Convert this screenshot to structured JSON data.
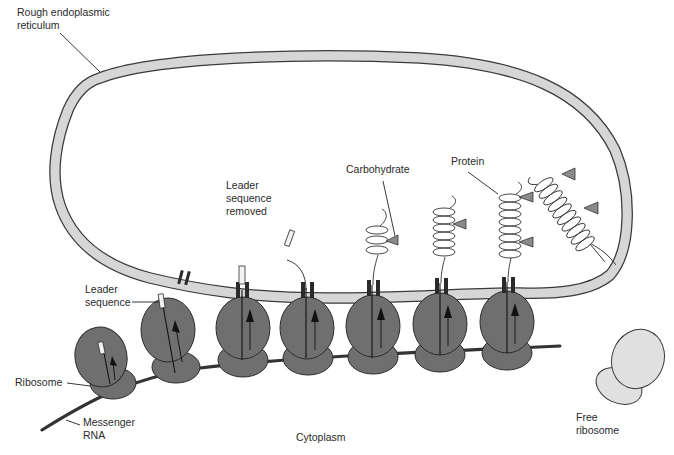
{
  "diagram": {
    "labels": {
      "rough_er": [
        "Rough endoplasmic",
        "reticulum"
      ],
      "leader_sequence_removed": [
        "Leader",
        "sequence",
        "removed"
      ],
      "carbohydrate": "Carbohydrate",
      "protein": "Protein",
      "leader_sequence": [
        "Leader",
        "sequence"
      ],
      "ribosome": "Ribosome",
      "messenger_rna": [
        "Messenger",
        "RNA"
      ],
      "cytoplasm": "Cytoplasm",
      "free_ribosome": [
        "Free",
        "ribosome"
      ]
    },
    "colors": {
      "membrane_fill": "#d6d6d6",
      "membrane_edge": "#3a3a3a",
      "bound_ribosome": "#6f6f6f",
      "free_ribosome": "#e0e0e0",
      "carbohydrate": "#8a8a8a",
      "mrna": "#333333"
    },
    "stages": [
      {
        "id": 1,
        "description": "Ribosome begins translation, leader sequence emerging"
      },
      {
        "id": 2,
        "description": "Leader sequence approaches ER membrane"
      },
      {
        "id": 3,
        "description": "Leader sequence passes through membrane channel"
      },
      {
        "id": 4,
        "description": "Leader sequence removed"
      },
      {
        "id": 5,
        "description": "Growing protein with carbohydrate attached"
      },
      {
        "id": 6,
        "description": "Longer protein with carbohydrate"
      },
      {
        "id": 7,
        "description": "Protein with two carbohydrates"
      },
      {
        "id": 8,
        "description": "Completed protein released into ER lumen"
      }
    ]
  }
}
